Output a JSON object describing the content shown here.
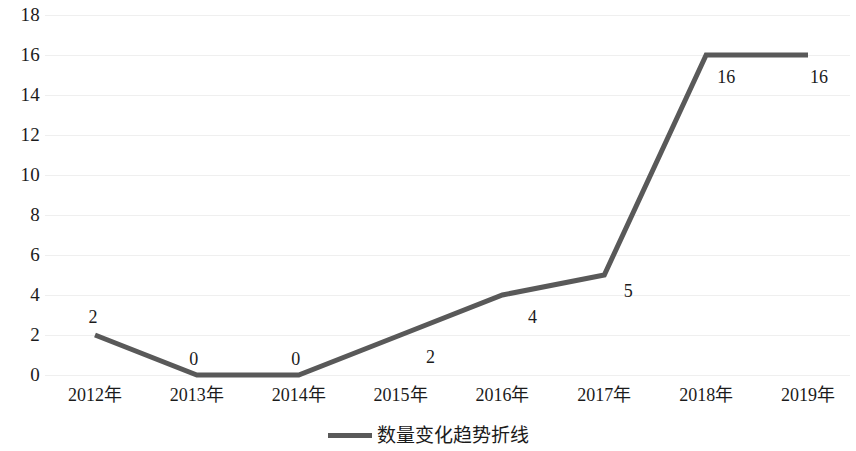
{
  "chart_data": {
    "type": "line",
    "title": "",
    "subtitle": "",
    "xlabel": "",
    "ylabel": "",
    "categories": [
      "2012年",
      "2013年",
      "2014年",
      "2015年",
      "2016年",
      "2017年",
      "2018年",
      "2019年"
    ],
    "series": [
      {
        "name": "数量变化趋势折线",
        "values": [
          2,
          0,
          0,
          2,
          4,
          5,
          16,
          16
        ],
        "color": "#595959",
        "line_width": 5,
        "show_data_labels": true
      }
    ],
    "ylim": [
      0,
      18
    ],
    "y_ticks": [
      0,
      2,
      4,
      6,
      8,
      10,
      12,
      14,
      16,
      18
    ],
    "y_tick_labels": [
      "0",
      "2",
      "4",
      "6",
      "8",
      "10",
      "12",
      "14",
      "16",
      "18"
    ],
    "data_labels": [
      "2",
      "0",
      "0",
      "2",
      "4",
      "5",
      "16",
      "16"
    ],
    "grid": {
      "horizontal": true,
      "vertical": false,
      "color": "#efefef"
    },
    "legend": {
      "position": "bottom",
      "entries": [
        {
          "label": "数量变化趋势折线",
          "marker": "line-swatch",
          "color": "#595959"
        }
      ]
    },
    "background_color": "#ffffff",
    "axis_label_color": "#1b1b1b"
  }
}
